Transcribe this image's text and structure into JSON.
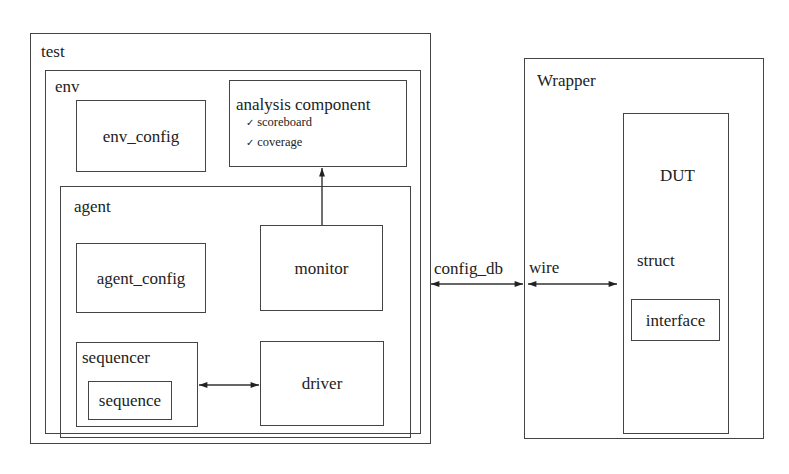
{
  "diagram": {
    "test": {
      "label": "test"
    },
    "env": {
      "label": "env"
    },
    "env_config": {
      "label": "env_config"
    },
    "analysis": {
      "label": "analysis component",
      "items": [
        {
          "check": "✓",
          "label": "scoreboard"
        },
        {
          "check": "✓",
          "label": "coverage"
        }
      ]
    },
    "agent": {
      "label": "agent"
    },
    "agent_config": {
      "label": "agent_config"
    },
    "monitor": {
      "label": "monitor"
    },
    "sequencer": {
      "label": "sequencer"
    },
    "sequence": {
      "label": "sequence"
    },
    "driver": {
      "label": "driver"
    },
    "wrapper": {
      "label": "Wrapper"
    },
    "dut": {
      "label": "DUT",
      "struct_label": "struct"
    },
    "interface": {
      "label": "interface"
    },
    "connections": {
      "config_db": "config_db",
      "wire": "wire"
    }
  }
}
